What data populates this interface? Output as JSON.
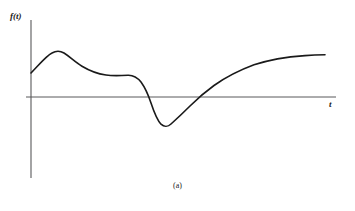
{
  "figure": {
    "caption": "(a)",
    "background_color": "#ffffff",
    "axis_color": "#58585a",
    "curve_color": "#1a1a1a"
  },
  "axes": {
    "y_axis_label": "f(t)",
    "x_axis_label": "t",
    "origin_px": {
      "x": 31,
      "y": 97
    },
    "y_axis_extent_px": {
      "x": 31,
      "y_top": 20,
      "y_bottom": 178
    },
    "x_axis_extent_px": {
      "y": 97,
      "x_left": 26,
      "x_right": 336
    }
  },
  "chart_data": {
    "type": "line",
    "title": "",
    "xlabel": "t",
    "ylabel": "f(t)",
    "grid": false,
    "legend": null,
    "axis_style": "two-axis-no-ticks",
    "x": [
      31,
      38,
      45,
      52,
      57,
      63,
      70,
      78,
      86,
      95,
      104,
      112,
      120,
      128,
      134,
      140,
      145,
      149,
      153,
      158,
      165,
      172,
      180,
      188,
      196,
      204,
      212,
      222,
      234,
      248,
      262,
      276,
      292,
      308,
      325
    ],
    "y_pixels": [
      73,
      66,
      59,
      54,
      51,
      52,
      56,
      62,
      67,
      71,
      74,
      75,
      75,
      75,
      76,
      80,
      88,
      97,
      108,
      119,
      126,
      124,
      118,
      111,
      104,
      97,
      90,
      82,
      74,
      67,
      62,
      59,
      57,
      56,
      55
    ],
    "values": [
      0.52,
      0.72,
      0.91,
      1.05,
      1.13,
      1.1,
      1.0,
      0.84,
      0.73,
      0.62,
      0.53,
      0.5,
      0.5,
      0.5,
      0.47,
      0.35,
      0.14,
      -0.02,
      -0.13,
      -0.46,
      -0.74,
      -0.68,
      -0.52,
      -0.34,
      -0.16,
      0.0,
      0.16,
      0.38,
      0.59,
      0.77,
      0.9,
      0.98,
      1.04,
      1.07,
      1.09
    ],
    "key_points": [
      {
        "name": "start",
        "x": 31,
        "y": 73,
        "note": "initial positive value at t=0"
      },
      {
        "name": "local-maximum",
        "x": 57,
        "y": 51
      },
      {
        "name": "shoulder-plateau",
        "x": 120,
        "y": 75
      },
      {
        "name": "first-zero-crossing",
        "x": 149,
        "y": 97
      },
      {
        "name": "global-minimum",
        "x": 165,
        "y": 126
      },
      {
        "name": "second-zero-crossing",
        "x": 204,
        "y": 97
      },
      {
        "name": "asymptote-end",
        "x": 325,
        "y": 55
      }
    ],
    "zero_crossings": [
      149,
      204
    ],
    "ylim": [
      -1.0,
      1.4
    ],
    "xlim": [
      26,
      336
    ]
  }
}
